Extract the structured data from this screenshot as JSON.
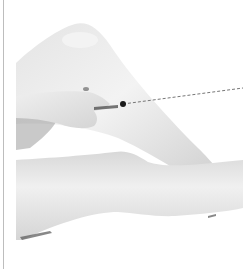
{
  "illustration": {
    "subject": "legs-with-hand-pressing-acupoint",
    "colors": {
      "background": "#ffffff",
      "skin_light": "#f1f1f1",
      "skin_mid": "#d9d9d9",
      "skin_shadow": "#a8a8a8",
      "marker": "#1a1a1a",
      "leader_line": "#777777",
      "border_rule": "#bdbdbd"
    },
    "marker_point": {
      "x": 123,
      "y": 104
    },
    "leader_line_end": {
      "x": 243,
      "y": 88
    }
  }
}
